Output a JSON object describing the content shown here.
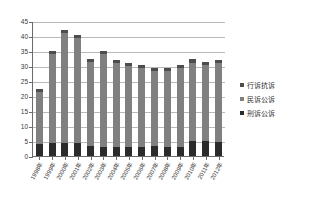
{
  "chart_data": {
    "type": "bar",
    "stacked": true,
    "title": "",
    "subtitle": "",
    "xlabel": "",
    "ylabel": "",
    "ylim": [
      0,
      45
    ],
    "ytick_step": 5,
    "yticks": [
      45,
      40,
      35,
      30,
      25,
      20,
      15,
      10,
      5,
      0
    ],
    "grid": true,
    "legend_position": "right",
    "categories": [
      "1998年",
      "1999年",
      "2000年",
      "2001年",
      "2002年",
      "2003年",
      "2004年",
      "2005年",
      "2006年",
      "2007年",
      "2008年",
      "2009年",
      "2010年",
      "2011年",
      "2012年"
    ],
    "series": [
      {
        "name": "刑诉公诉",
        "color": "#2b2b2b",
        "values": [
          4.0,
          4.2,
          4.5,
          4.3,
          3.2,
          3.0,
          3.0,
          3.0,
          3.0,
          3.2,
          3.0,
          3.0,
          5.0,
          5.0,
          4.8
        ]
      },
      {
        "name": "民诉公诉",
        "color": "#808080",
        "values": [
          17.5,
          29.8,
          36.5,
          35.2,
          28.0,
          31.0,
          28.0,
          27.0,
          26.5,
          25.0,
          25.5,
          26.5,
          26.0,
          25.5,
          26.2
        ]
      },
      {
        "name": "行诉抗诉",
        "color": "#4d4d4d",
        "values": [
          1.0,
          1.0,
          1.0,
          1.0,
          1.0,
          1.0,
          1.0,
          1.0,
          1.0,
          1.0,
          1.0,
          1.0,
          1.5,
          1.0,
          1.0
        ]
      }
    ],
    "totals": [
      22.5,
      35.0,
      42.0,
      40.5,
      32.2,
      35.0,
      32.0,
      31.0,
      30.5,
      29.2,
      29.5,
      30.5,
      32.5,
      31.5,
      32.0
    ]
  },
  "legend": {
    "items": [
      {
        "label": "行诉抗诉",
        "color": "#4d4d4d"
      },
      {
        "label": "民诉公诉",
        "color": "#808080"
      },
      {
        "label": "刑诉公诉",
        "color": "#2b2b2b"
      }
    ]
  },
  "axes": {
    "y_axis_color": "#6b6b6b",
    "gridline_color": "#b9b9b9",
    "background": "#ffffff"
  }
}
